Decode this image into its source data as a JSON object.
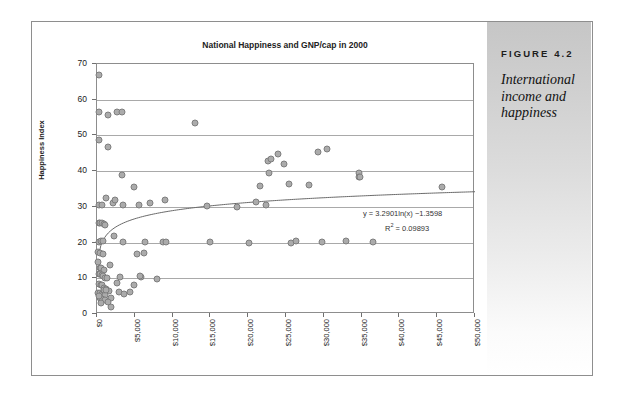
{
  "figure": {
    "label": "FIGURE 4.2",
    "caption": "International income and happiness"
  },
  "chart_data": {
    "type": "scatter",
    "title": "National Happiness and GNP/cap in 2000",
    "xlabel": "",
    "ylabel": "Happiness Index",
    "xlim": [
      0,
      50000
    ],
    "ylim": [
      0,
      70
    ],
    "xticks": [
      "$0",
      "$5,000",
      "$10,000",
      "$15,000",
      "$20,000",
      "$25,000",
      "$30,000",
      "$35,000",
      "$40,000",
      "$45,000",
      "$50,000"
    ],
    "xtick_values": [
      0,
      5000,
      10000,
      15000,
      20000,
      25000,
      30000,
      35000,
      40000,
      45000,
      50000
    ],
    "yticks": [
      "0",
      "10",
      "20",
      "30",
      "40",
      "50",
      "60",
      "70"
    ],
    "ytick_values": [
      0,
      10,
      20,
      30,
      40,
      50,
      60,
      70
    ],
    "grid": "horizontal",
    "legend": "none",
    "annotations": {
      "equation": "y = 3.2901ln(x) −1.3598",
      "r_squared_label": "R",
      "r_squared_exponent": "2",
      "r_squared_value": "= 0.09893"
    },
    "trendline": {
      "type": "logarithmic",
      "a": 3.2901,
      "b": -1.3598,
      "r2": 0.09893
    },
    "marker": {
      "fill": "#ababab",
      "stroke": "#7e7e7e",
      "size": 7
    },
    "points": [
      [
        300,
        66.8
      ],
      [
        300,
        56.6
      ],
      [
        1400,
        55.6
      ],
      [
        2700,
        56.5
      ],
      [
        3300,
        56.6
      ],
      [
        12900,
        53.5
      ],
      [
        320,
        48.8
      ],
      [
        1500,
        46.9
      ],
      [
        3300,
        38.9
      ],
      [
        4900,
        35.6
      ],
      [
        1200,
        32.6
      ],
      [
        2100,
        31.0
      ],
      [
        2400,
        31.8
      ],
      [
        3500,
        30.6
      ],
      [
        200,
        30.6
      ],
      [
        600,
        30.4
      ],
      [
        5500,
        30.5
      ],
      [
        7000,
        31.2
      ],
      [
        9000,
        31.9
      ],
      [
        14500,
        30.3
      ],
      [
        18500,
        30.1
      ],
      [
        21000,
        31.3
      ],
      [
        22400,
        30.6
      ],
      [
        22600,
        42.8
      ],
      [
        23000,
        43.5
      ],
      [
        23900,
        44.8
      ],
      [
        24700,
        42.1
      ],
      [
        22800,
        39.6
      ],
      [
        21600,
        35.9
      ],
      [
        25400,
        36.3
      ],
      [
        28000,
        36.0
      ],
      [
        29200,
        45.5
      ],
      [
        30400,
        46.2
      ],
      [
        34600,
        39.4
      ],
      [
        34700,
        38.5
      ],
      [
        34800,
        38.3
      ],
      [
        45600,
        35.7
      ],
      [
        250,
        25.6
      ],
      [
        400,
        25.4
      ],
      [
        700,
        25.6
      ],
      [
        900,
        25.2
      ],
      [
        1000,
        25.0
      ],
      [
        200,
        20.3
      ],
      [
        500,
        20.5
      ],
      [
        750,
        20.4
      ],
      [
        2300,
        21.9
      ],
      [
        3400,
        20.2
      ],
      [
        6400,
        20.1
      ],
      [
        8700,
        20.1
      ],
      [
        9100,
        20.2
      ],
      [
        14900,
        20.1
      ],
      [
        20100,
        19.9
      ],
      [
        25700,
        20.0
      ],
      [
        26300,
        20.5
      ],
      [
        29700,
        20.1
      ],
      [
        33000,
        20.4
      ],
      [
        36500,
        20.3
      ],
      [
        150,
        17.3
      ],
      [
        450,
        17.2
      ],
      [
        800,
        16.9
      ],
      [
        5300,
        16.7
      ],
      [
        6200,
        17.2
      ],
      [
        100,
        14.7
      ],
      [
        1700,
        13.6
      ],
      [
        350,
        13.0
      ],
      [
        550,
        12.8
      ],
      [
        900,
        12.3
      ],
      [
        200,
        11.3
      ],
      [
        400,
        11.2
      ],
      [
        600,
        11.0
      ],
      [
        800,
        10.6
      ],
      [
        1000,
        10.2
      ],
      [
        1300,
        10.0
      ],
      [
        3100,
        10.5
      ],
      [
        5800,
        10.3
      ],
      [
        8000,
        9.8
      ],
      [
        2700,
        8.8
      ],
      [
        250,
        8.3
      ],
      [
        500,
        8.2
      ],
      [
        700,
        8.0
      ],
      [
        950,
        7.4
      ],
      [
        1200,
        7.1
      ],
      [
        1600,
        6.4
      ],
      [
        150,
        6.0
      ],
      [
        350,
        5.8
      ],
      [
        600,
        5.5
      ],
      [
        850,
        5.3
      ],
      [
        1100,
        5.2
      ],
      [
        1900,
        4.5
      ],
      [
        2900,
        6.2
      ],
      [
        3600,
        5.6
      ],
      [
        4300,
        6.3
      ],
      [
        4900,
        8.1
      ],
      [
        5700,
        10.6
      ],
      [
        400,
        4.4
      ],
      [
        700,
        4.2
      ],
      [
        1000,
        3.9
      ],
      [
        1500,
        3.4
      ],
      [
        1800,
        2.1
      ],
      [
        550,
        3.1
      ],
      [
        300,
        5.0
      ],
      [
        900,
        6.6
      ],
      [
        1250,
        6.8
      ]
    ]
  }
}
